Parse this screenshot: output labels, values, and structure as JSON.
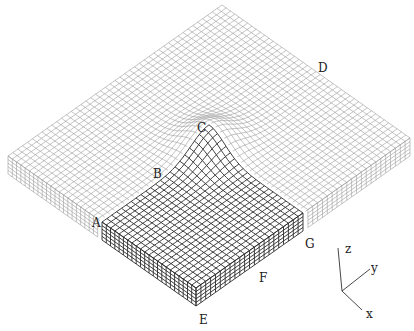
{
  "figure": {
    "background": "#ffffff",
    "light_mesh_color": "#9a9a9a",
    "dark_mesh_color": "#2a2a2a"
  },
  "geometry": {
    "top_back": [
      222,
      5
    ],
    "top_left": [
      8,
      156
    ],
    "top_right": [
      410,
      138
    ],
    "top_front": [
      196,
      288
    ],
    "thickness_px": 18,
    "grid_u": 44,
    "grid_v": 44,
    "layers": 5,
    "bump": {
      "center_u": 0.5,
      "center_v": 0.5,
      "height_px": 22,
      "radius": 0.12
    },
    "highlight": {
      "u_from": 0.5,
      "u_to": 1.0,
      "v_from": 0.5,
      "v_to": 1.0
    }
  },
  "labels": {
    "A": {
      "text": "A",
      "x": 92,
      "y": 217
    },
    "B": {
      "text": "B",
      "x": 153,
      "y": 168
    },
    "C": {
      "text": "C",
      "x": 197,
      "y": 122
    },
    "D": {
      "text": "D",
      "x": 318,
      "y": 62
    },
    "E": {
      "text": "E",
      "x": 199,
      "y": 314
    },
    "F": {
      "text": "F",
      "x": 259,
      "y": 272
    },
    "G": {
      "text": "G",
      "x": 305,
      "y": 238
    }
  },
  "axes": {
    "origin": [
      342,
      291
    ],
    "z": {
      "label": "z",
      "end": [
        338,
        248
      ],
      "label_pos": [
        345,
        243
      ]
    },
    "y": {
      "label": "y",
      "end": [
        370,
        269
      ],
      "label_pos": [
        371,
        262
      ]
    },
    "x": {
      "label": "x",
      "end": [
        362,
        310
      ],
      "label_pos": [
        366,
        308
      ]
    }
  }
}
